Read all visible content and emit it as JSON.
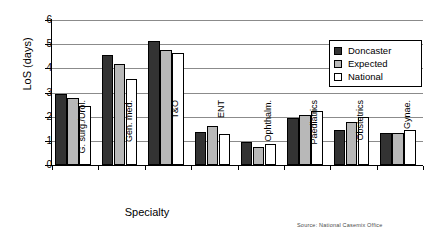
{
  "chart_data": {
    "type": "bar",
    "title": "",
    "xlabel": "Specialty",
    "ylabel": "LoS (days)",
    "ylim": [
      0,
      6
    ],
    "yticks": [
      0,
      1,
      2,
      3,
      4,
      5,
      6
    ],
    "ytick_labels": [
      "0",
      "1",
      "2",
      "3",
      "4",
      "5",
      "6"
    ],
    "grid": true,
    "legend_position": "upper right",
    "categories": [
      "G. surg./Urol.",
      "Gen. med.",
      "T&O",
      "ENT",
      "Ophthalm.",
      "Paediatrics",
      "Obstetrics",
      "Gynae."
    ],
    "series": [
      {
        "name": "Doncaster",
        "color": "#333333",
        "values": [
          2.95,
          4.55,
          5.15,
          1.36,
          0.97,
          1.95,
          1.45,
          1.33
        ]
      },
      {
        "name": "Expected",
        "color": "#b8b8b8",
        "values": [
          2.76,
          4.2,
          4.75,
          1.62,
          0.76,
          2.08,
          1.8,
          1.33
        ]
      },
      {
        "name": "National",
        "color": "#ffffff",
        "values": [
          2.45,
          3.55,
          4.65,
          1.29,
          0.87,
          2.22,
          1.97,
          1.46
        ]
      }
    ],
    "annotations": [
      {
        "name": "source-note",
        "text": "Source: National Casemix Office"
      }
    ]
  },
  "legend": {
    "items": [
      {
        "label": "Doncaster",
        "swatch": "doncaster"
      },
      {
        "label": "Expected",
        "swatch": "expected"
      },
      {
        "label": "National",
        "swatch": "national"
      }
    ]
  },
  "source": {
    "text": "Source: National Casemix Office"
  }
}
